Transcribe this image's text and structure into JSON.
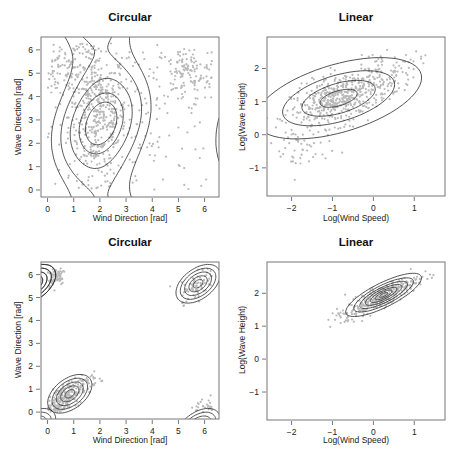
{
  "chart_data": [
    {
      "id": "top-left",
      "type": "scatter",
      "title": "Circular",
      "xlabel": "Wind Direction [rad]",
      "ylabel": "Wave Direction [rad]",
      "xlim": [
        -0.25,
        6.55
      ],
      "ylim": [
        -0.3,
        6.55
      ],
      "xticks": [
        0,
        1,
        2,
        3,
        4,
        5,
        6
      ],
      "yticks": [
        0,
        1,
        2,
        3,
        4,
        5,
        6
      ],
      "box": {
        "x": 41,
        "y": 37,
        "w": 178,
        "h": 160
      },
      "overlay": "density-contours",
      "contour_center": [
        2.05,
        2.85
      ],
      "clusters": [
        {
          "cx": 1.9,
          "cy": 3.2,
          "sx": 0.55,
          "sy": 1.4,
          "n": 420
        },
        {
          "cx": 0.9,
          "cy": 5.2,
          "sx": 0.7,
          "sy": 0.6,
          "n": 120
        },
        {
          "cx": 5.3,
          "cy": 5.0,
          "sx": 0.6,
          "sy": 0.6,
          "n": 110
        },
        {
          "cx": 3.5,
          "cy": 3.5,
          "sx": 1.6,
          "sy": 1.8,
          "n": 140
        }
      ],
      "grid": false
    },
    {
      "id": "top-right",
      "type": "scatter",
      "title": "Linear",
      "xlabel": "Log(Wind Speed)",
      "ylabel": "Log(Wave Height)",
      "xlim": [
        -2.6,
        1.75
      ],
      "ylim": [
        -1.85,
        2.95
      ],
      "xticks": [
        -2,
        -1,
        0,
        1
      ],
      "yticks": [
        -1,
        0,
        1,
        2
      ],
      "box": {
        "x": 267,
        "y": 37,
        "w": 178,
        "h": 159
      },
      "overlay": "gaussian-ellipses",
      "ellipse_center": [
        -0.85,
        1.1
      ],
      "ellipse_radii": [
        [
          0.48,
          0.22
        ],
        [
          0.95,
          0.44
        ],
        [
          1.45,
          0.68
        ],
        [
          2.15,
          1.0
        ]
      ],
      "ellipse_angle_deg": 22,
      "clusters": [
        {
          "cx": -0.8,
          "cy": 1.1,
          "sx": 0.6,
          "sy": 0.45,
          "rho": 0.55,
          "n": 520
        },
        {
          "cx": -1.8,
          "cy": -0.5,
          "sx": 0.35,
          "sy": 0.4,
          "rho": 0.1,
          "n": 40
        },
        {
          "cx": 0.5,
          "cy": 1.9,
          "sx": 0.35,
          "sy": 0.3,
          "rho": 0.4,
          "n": 60
        }
      ],
      "grid": false
    },
    {
      "id": "bottom-left",
      "type": "scatter",
      "title": "Circular",
      "xlabel": "Wind Direction [rad]",
      "ylabel": "Wave Direction [rad]",
      "xlim": [
        -0.25,
        6.55
      ],
      "ylim": [
        -0.3,
        6.55
      ],
      "xticks": [
        0,
        1,
        2,
        3,
        4,
        5,
        6
      ],
      "yticks": [
        0,
        1,
        2,
        3,
        4,
        5,
        6
      ],
      "box": {
        "x": 41,
        "y": 262,
        "w": 178,
        "h": 157
      },
      "overlay": "wrapped-density-contours",
      "ellipse_center": [
        0.85,
        0.8
      ],
      "wrapped_center": [
        5.75,
        5.6
      ],
      "ellipse_radii": [
        [
          0.22,
          0.14
        ],
        [
          0.42,
          0.26
        ],
        [
          0.62,
          0.38
        ],
        [
          0.82,
          0.5
        ],
        [
          1.02,
          0.62
        ]
      ],
      "ellipse_angle_deg": 45,
      "clusters": [
        {
          "cx": 0.55,
          "cy": 0.55,
          "sx": 0.38,
          "sy": 0.38,
          "rho": 0.6,
          "n": 260
        },
        {
          "cx": 1.7,
          "cy": 1.35,
          "sx": 0.2,
          "sy": 0.2,
          "rho": 0.2,
          "n": 25
        },
        {
          "cx": 0.3,
          "cy": 5.9,
          "sx": 0.2,
          "sy": 0.25,
          "rho": 0.4,
          "n": 60
        },
        {
          "cx": 5.7,
          "cy": 5.45,
          "sx": 0.3,
          "sy": 0.3,
          "rho": 0.5,
          "n": 70
        },
        {
          "cx": 5.9,
          "cy": 0.2,
          "sx": 0.25,
          "sy": 0.15,
          "rho": 0.3,
          "n": 12
        }
      ],
      "grid": false
    },
    {
      "id": "bottom-right",
      "type": "scatter",
      "title": "Linear",
      "xlabel": "Log(Wind Speed)",
      "ylabel": "Log(Wave Height)",
      "xlim": [
        -2.6,
        1.75
      ],
      "ylim": [
        -1.85,
        2.95
      ],
      "xticks": [
        -2,
        -1,
        0,
        1
      ],
      "yticks": [
        -1,
        0,
        1,
        2
      ],
      "box": {
        "x": 267,
        "y": 262,
        "w": 178,
        "h": 158
      },
      "overlay": "gaussian-ellipses",
      "ellipse_center": [
        0.25,
        1.95
      ],
      "ellipse_radii": [
        [
          0.12,
          0.04
        ],
        [
          0.24,
          0.08
        ],
        [
          0.38,
          0.12
        ],
        [
          0.52,
          0.17
        ],
        [
          0.68,
          0.22
        ],
        [
          0.85,
          0.28
        ],
        [
          1.08,
          0.35
        ]
      ],
      "ellipse_angle_deg": 33,
      "clusters": [
        {
          "cx": 0.2,
          "cy": 1.9,
          "sx": 0.45,
          "sy": 0.3,
          "rho": 0.85,
          "n": 320
        },
        {
          "cx": -0.7,
          "cy": 1.3,
          "sx": 0.2,
          "sy": 0.15,
          "rho": 0.4,
          "n": 20
        }
      ],
      "grid": false
    }
  ]
}
